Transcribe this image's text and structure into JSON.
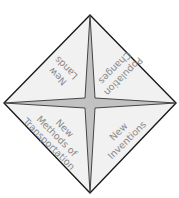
{
  "diagram": {
    "type": "diamond-foldable",
    "colors": {
      "background": "#ffffff",
      "triangle_fill": "#f1f1f1",
      "star_fill": "#c2c2c2",
      "outline": "#1a1a1a",
      "text": "#8a8a8a"
    },
    "sections": [
      {
        "position": "top-left",
        "lines": [
          "New",
          "Lands"
        ]
      },
      {
        "position": "top-right",
        "lines": [
          "Population",
          "Changes"
        ]
      },
      {
        "position": "bottom-left",
        "lines": [
          "New",
          "Methods of",
          "Transportation"
        ]
      },
      {
        "position": "bottom-right",
        "lines": [
          "New",
          "Inventions"
        ]
      }
    ]
  }
}
